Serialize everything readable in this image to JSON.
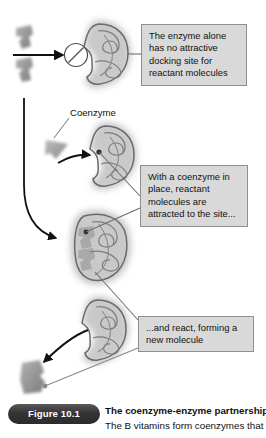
{
  "figure": {
    "pill_label": "Figure 10.1",
    "caption_title": "The coenzyme-enzyme partnership.",
    "caption_body": "The B vitamins form coenzymes that"
  },
  "labels": {
    "coenzyme": "Coenzyme"
  },
  "callouts": [
    {
      "id": "callout-1",
      "text": "The enzyme alone has no attractive docking site for reactant molecules"
    },
    {
      "id": "callout-2",
      "text": "With a coenzyme in place, reactant molecules are attracted to the site..."
    },
    {
      "id": "callout-3",
      "text": "...and react, forming a new molecule"
    }
  ],
  "stages": [
    {
      "name": "enzyme-alone",
      "description": "Open C-shaped enzyme with no docking site; reactant molecules blocked"
    },
    {
      "name": "enzyme-with-coenzyme",
      "description": "Coenzyme wedge binds into the enzyme cleft"
    },
    {
      "name": "reactants-attracted",
      "description": "Reactant molecules docked at the active site"
    },
    {
      "name": "product-released",
      "description": "New fused molecule released from the enzyme"
    }
  ],
  "colors": {
    "callout_fill": "#d9d9d9",
    "callout_border": "#8f8f8f",
    "enzyme_outline": "#6b6b6b",
    "enzyme_halo": "#c9c9c9",
    "molecule_fill": "#9a9a9a",
    "arrow": "#111111",
    "leader_line": "#6f6f6f",
    "pill_fill": "#343434",
    "text": "#111111"
  }
}
